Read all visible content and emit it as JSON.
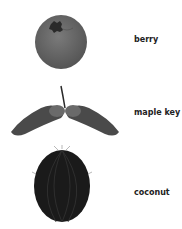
{
  "items": [
    {
      "label": "berry",
      "icon": "berry-icon",
      "color": "#6e6e6e"
    },
    {
      "label": "maple key",
      "icon": "maple-key-icon",
      "color": "#4a4a4a"
    },
    {
      "label": "coconut",
      "icon": "coconut-icon",
      "color": "#1a1a1a"
    }
  ]
}
